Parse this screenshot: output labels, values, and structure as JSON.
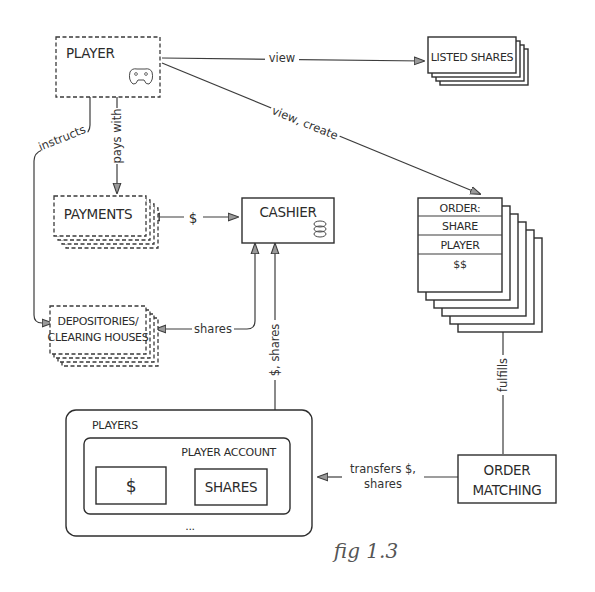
{
  "diagram": {
    "caption": "fig 1.3",
    "nodes": {
      "player": {
        "label": "PLAYER",
        "icon": "gamepad-icon",
        "style": "dashed"
      },
      "listed_shares": {
        "label": "LISTED SHARES",
        "style": "stacked"
      },
      "payments": {
        "label": "PAYMENTS",
        "style": "dashed-stacked"
      },
      "cashier": {
        "label": "CASHIER",
        "icon": "coins-icon",
        "style": "solid"
      },
      "order": {
        "style": "stacked",
        "rows": [
          "ORDER:",
          "SHARE",
          "PLAYER",
          "$$"
        ]
      },
      "depositories": {
        "label_line1": "DEPOSITORIES/",
        "label_line2": "CLEARING HOUSES",
        "style": "dashed-stacked"
      },
      "players": {
        "label": "PLAYERS",
        "account": {
          "label": "PLAYER ACCOUNT",
          "cash": "$",
          "shares": "SHARES"
        },
        "more": "..."
      },
      "order_matching": {
        "label_line1": "ORDER",
        "label_line2": "MATCHING",
        "style": "solid"
      }
    },
    "edges": [
      {
        "from": "player",
        "to": "listed_shares",
        "label": "view"
      },
      {
        "from": "player",
        "to": "order",
        "label": "view, create"
      },
      {
        "from": "player",
        "to": "payments",
        "label": "pays with"
      },
      {
        "from": "player",
        "to": "depositories",
        "label": "instructs"
      },
      {
        "from": "payments",
        "to": "cashier",
        "label": "$",
        "bidirectional": true
      },
      {
        "from": "cashier",
        "to": "depositories",
        "label": "shares"
      },
      {
        "from": "cashier",
        "to": "players",
        "label": "$, shares",
        "bidirectional": true
      },
      {
        "from": "order_matching",
        "to": "order",
        "label": "fulfills"
      },
      {
        "from": "order_matching",
        "to": "players",
        "label_line1": "transfers $,",
        "label_line2": "shares"
      }
    ]
  }
}
